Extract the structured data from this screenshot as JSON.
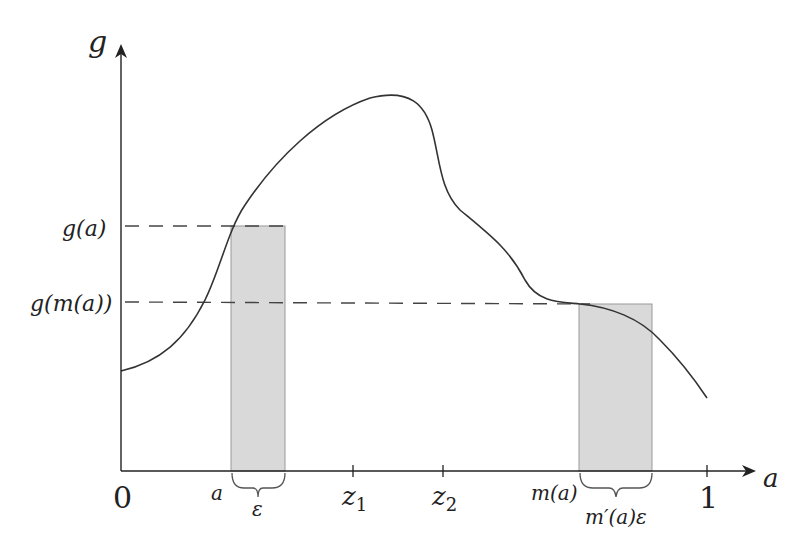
{
  "diagram": {
    "title": "",
    "axes": {
      "y_label": "g",
      "x_label": "a",
      "origin_label": "0",
      "x_end_label": "1"
    },
    "y_labels": {
      "g_a": "g(a)",
      "g_m_a": "g(m(a))"
    },
    "x_markers": {
      "a": "a",
      "z1_base": "z",
      "z1_sub": "1",
      "z2_base": "z",
      "z2_sub": "2",
      "m_a": "m(a)"
    },
    "braces": {
      "left": "ε",
      "right": "m′(a)ε"
    },
    "colors": {
      "curve": "#333333",
      "axis": "#222222",
      "dash": "#444444",
      "rect_fill": "#d9d9d9",
      "rect_stroke": "#999999"
    }
  }
}
